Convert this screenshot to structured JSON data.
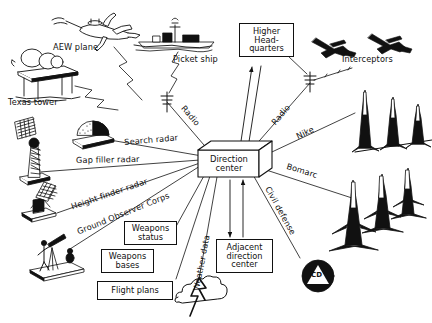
{
  "diagram": {
    "background_color": "#ffffff",
    "ink_color": "#111111",
    "center_node": {
      "name": "direction-center",
      "label_line1": "Direction",
      "label_line2": "center"
    },
    "boxes": [
      {
        "id": "higher-headquarters",
        "lines": [
          "Higher",
          "Head-",
          "quarters"
        ]
      },
      {
        "id": "weapons-status",
        "lines": [
          "Weapons",
          "status"
        ]
      },
      {
        "id": "weapons-bases",
        "lines": [
          "Weapons",
          "bases"
        ]
      },
      {
        "id": "flight-plans",
        "lines": [
          "Flight plans"
        ]
      },
      {
        "id": "adjacent-direction-center",
        "lines": [
          "Adjacent",
          "direction",
          "center"
        ]
      }
    ],
    "entity_labels": [
      {
        "id": "aew-plane",
        "text": "AEW plane"
      },
      {
        "id": "picket-ship",
        "text": "Picket ship"
      },
      {
        "id": "texas-tower",
        "text": "Texas tower"
      },
      {
        "id": "interceptors",
        "text": "Interceptors"
      }
    ],
    "link_labels": [
      {
        "id": "radio-left",
        "text": "Radio"
      },
      {
        "id": "radio-right",
        "text": "Radio"
      },
      {
        "id": "search-radar",
        "text": "Search radar"
      },
      {
        "id": "gap-filler-radar",
        "text": "Gap filler radar"
      },
      {
        "id": "height-finder-radar",
        "text": "Height finder radar"
      },
      {
        "id": "ground-observer-corps",
        "text": "Ground Observer Corps"
      },
      {
        "id": "weather-data",
        "text": "Weather data"
      },
      {
        "id": "nike",
        "text": "Nike"
      },
      {
        "id": "bomarc",
        "text": "Bomarc"
      },
      {
        "id": "civil-defense",
        "text": "Civil defense"
      }
    ],
    "symbols": [
      {
        "id": "civil-defense-badge",
        "text": "CD"
      }
    ],
    "icons": [
      {
        "id": "aew-plane-icon",
        "name": "airplane-icon"
      },
      {
        "id": "picket-ship-icon",
        "name": "ship-icon"
      },
      {
        "id": "texas-tower-icon",
        "name": "offshore-radar-platform-icon"
      },
      {
        "id": "search-radar-icon",
        "name": "radar-dome-icon"
      },
      {
        "id": "gap-filler-radar-icon",
        "name": "radar-tower-icon"
      },
      {
        "id": "height-finder-radar-icon",
        "name": "mesh-antenna-icon"
      },
      {
        "id": "ground-observer-icon",
        "name": "observer-with-telescope-icon"
      },
      {
        "id": "weather-icon",
        "name": "cloud-lightning-icon"
      },
      {
        "id": "interceptor-icon",
        "name": "jet-fighter-icon"
      },
      {
        "id": "nike-icon",
        "name": "missile-battery-icon"
      },
      {
        "id": "bomarc-icon",
        "name": "missile-battery-icon"
      },
      {
        "id": "radio-mast-icon",
        "name": "antenna-mast-icon"
      }
    ]
  }
}
